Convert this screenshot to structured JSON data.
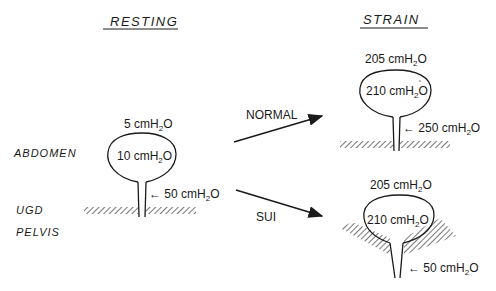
{
  "titles": {
    "resting": "RESTING",
    "strain": "STRAIN"
  },
  "regions": {
    "abdomen": "ABDOMEN",
    "ugd": "UGD",
    "pelvis": "PELVIS"
  },
  "arrows": {
    "normal": "NORMAL",
    "sui": "SUI"
  },
  "resting": {
    "abdominal_pressure": {
      "value": "5 cmH",
      "sub": "2",
      "tail": "O"
    },
    "bladder_pressure": {
      "value": "10 cmH",
      "sub": "2",
      "tail": "O"
    },
    "urethral_pressure": {
      "prefix": "← ",
      "value": "50 cmH",
      "sub": "2",
      "tail": "O"
    }
  },
  "strain_normal": {
    "abdominal_pressure": {
      "value": "205 cmH",
      "sub": "2",
      "tail": "O"
    },
    "bladder_pressure": {
      "value": "210 cmH",
      "sub": "2",
      "tail": "O"
    },
    "urethral_pressure": {
      "prefix": "← ",
      "value": "250 cmH",
      "sub": "2",
      "tail": "O"
    }
  },
  "strain_sui": {
    "abdominal_pressure": {
      "value": "205 cmH",
      "sub": "2",
      "tail": "O"
    },
    "bladder_pressure": {
      "value": "210 cmH",
      "sub": "2",
      "tail": "O"
    },
    "urethral_pressure": {
      "prefix": "← ",
      "value": "50 cmH",
      "sub": "2",
      "tail": "O"
    }
  },
  "colors": {
    "ink": "#1a1a1a",
    "background": "#ffffff"
  }
}
